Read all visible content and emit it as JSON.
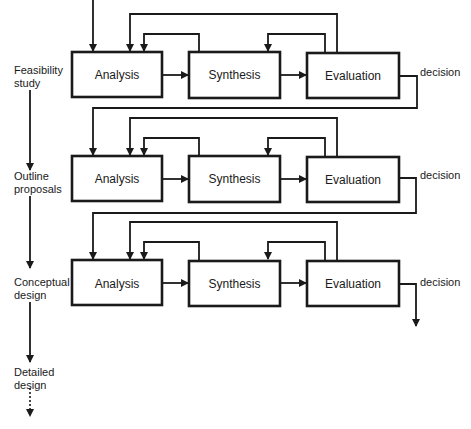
{
  "diagram": {
    "type": "process-flow",
    "stages": [
      {
        "label_line1": "Feasibility",
        "label_line2": "study"
      },
      {
        "label_line1": "Outline",
        "label_line2": "proposals"
      },
      {
        "label_line1": "Conceptual",
        "label_line2": "design"
      },
      {
        "label_line1": "Detailed",
        "label_line2": "design"
      }
    ],
    "rows": [
      {
        "analysis": "Analysis",
        "synthesis": "Synthesis",
        "evaluation": "Evaluation",
        "decision": "decision"
      },
      {
        "analysis": "Analysis",
        "synthesis": "Synthesis",
        "evaluation": "Evaluation",
        "decision": "decision"
      },
      {
        "analysis": "Analysis",
        "synthesis": "Synthesis",
        "evaluation": "Evaluation",
        "decision": "decision"
      }
    ],
    "colors": {
      "line": "#1a1a1a",
      "background": "#ffffff"
    }
  }
}
